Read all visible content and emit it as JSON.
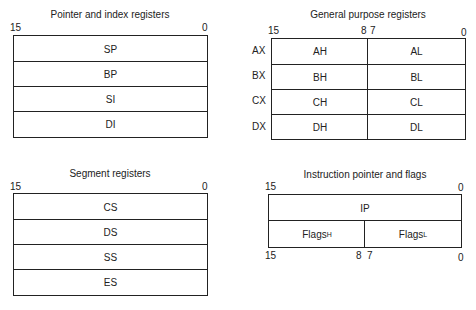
{
  "pointer_index": {
    "title": "Pointer and index registers",
    "bit_high": "15",
    "bit_low": "0",
    "registers": [
      "SP",
      "BP",
      "SI",
      "DI"
    ]
  },
  "general_purpose": {
    "title": "General purpose registers",
    "bit_15": "15",
    "bit_8": "8",
    "bit_7": "7",
    "bit_0": "0",
    "rows": [
      {
        "name": "AX",
        "high": "AH",
        "low": "AL"
      },
      {
        "name": "BX",
        "high": "BH",
        "low": "BL"
      },
      {
        "name": "CX",
        "high": "CH",
        "low": "CL"
      },
      {
        "name": "DX",
        "high": "DH",
        "low": "DL"
      }
    ]
  },
  "segment": {
    "title": "Segment registers",
    "bit_high": "15",
    "bit_low": "0",
    "registers": [
      "CS",
      "DS",
      "SS",
      "ES"
    ]
  },
  "ip_flags": {
    "title": "Instruction pointer and flags",
    "top_bit_high": "15",
    "top_bit_low": "0",
    "ip": "IP",
    "flags_base": "Flags",
    "flags_high_sub": "H",
    "flags_low_sub": "L",
    "bottom_bit_15": "15",
    "bottom_bit_8": "8",
    "bottom_bit_7": "7",
    "bottom_bit_0": "0"
  }
}
